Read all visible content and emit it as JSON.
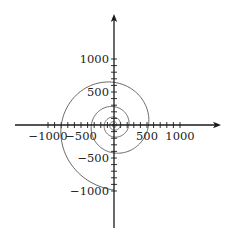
{
  "chart_data": {
    "type": "line",
    "title": "",
    "xlabel": "",
    "ylabel": "",
    "xlim": [
      -1500,
      1600
    ],
    "ylim": [
      -1560,
      1670
    ],
    "grid": false,
    "legend": null,
    "x_ticks": {
      "labels": [
        -1000,
        -500,
        500,
        1000
      ],
      "minor_step": 100,
      "minor_range": [
        -1000,
        1000
      ]
    },
    "y_ticks": {
      "labels": [
        1000,
        500,
        -500,
        -1000
      ],
      "minor_step": 100,
      "minor_range": [
        -1000,
        1000
      ]
    },
    "series": [
      {
        "name": "spiral",
        "kind": "logarithmic-spiral",
        "color": "#555555",
        "start_angle_deg": -90,
        "start_radius": 985,
        "direction": "clockwise",
        "radius_ratio_per_quarter_turn": 0.81,
        "end_radius": 8,
        "sample_points": [
          {
            "angle_deg": -90,
            "x": 0,
            "y": -985
          },
          {
            "angle_deg": -180,
            "x": -800,
            "y": 0
          },
          {
            "angle_deg": -270,
            "x": 0,
            "y": 636
          },
          {
            "angle_deg": -360,
            "x": 515,
            "y": 0
          },
          {
            "angle_deg": -450,
            "x": 0,
            "y": -424
          },
          {
            "angle_deg": -540,
            "x": -318,
            "y": 0
          }
        ]
      }
    ]
  },
  "axes": {
    "color": "#1a1a1a",
    "origin_px": [
      114,
      125
    ],
    "px_per_unit": 0.066,
    "x_axis": {
      "from_px": 15,
      "to_px": 221,
      "arrow": true
    },
    "y_axis": {
      "from_px": 228,
      "to_px": 14,
      "arrow": true
    }
  }
}
